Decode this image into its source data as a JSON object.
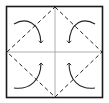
{
  "diagram": {
    "type": "origami-fold-instruction",
    "colors": {
      "background": "#ffffff",
      "outline": "#1a1a1a",
      "crease": "#9a9a9a",
      "dashed_fold": "#222222",
      "arrow": "#222222"
    },
    "square": {
      "x": 6,
      "y": 6,
      "w": 97,
      "h": 92
    },
    "center": {
      "x": 55,
      "y": 52
    },
    "arrows": [
      {
        "id": "top-left",
        "direction": "corner-to-center"
      },
      {
        "id": "top-right",
        "direction": "corner-to-center"
      },
      {
        "id": "bottom-left",
        "direction": "corner-to-center"
      },
      {
        "id": "bottom-right",
        "direction": "corner-to-center"
      }
    ]
  }
}
